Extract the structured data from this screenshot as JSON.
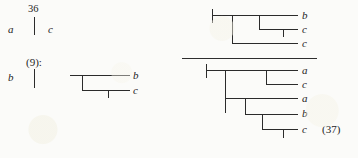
{
  "figure": {
    "type": "phylogenetic-tree-figure",
    "ink_color": "#2b2b2b",
    "background_color": "#fbfbf9"
  },
  "left_column": {
    "row_top": {
      "left_label": "a",
      "branch_length": "36",
      "right_label": "c"
    },
    "row_bottom": {
      "left_label": "b",
      "node_label": "(9):"
    }
  },
  "tree_left": {
    "leaves": [
      {
        "label": "b"
      },
      {
        "label": "c"
      }
    ]
  },
  "tree_top_right": {
    "leaves": [
      {
        "label": "b"
      },
      {
        "label": "c"
      },
      {
        "label": "c"
      }
    ]
  },
  "tree_bottom_right": {
    "leaves": [
      {
        "label": "a"
      },
      {
        "label": "c"
      },
      {
        "label": "a"
      },
      {
        "label": "b"
      },
      {
        "label": "c"
      }
    ],
    "caption": "(37)"
  }
}
